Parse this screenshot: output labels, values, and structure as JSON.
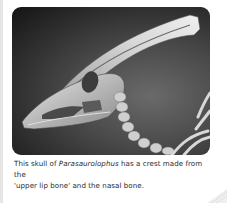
{
  "figure": {
    "image_alt": "Skull of Parasaurolophus with long backward-curving crest",
    "caption": {
      "prefix": "This skull of ",
      "species": "Parasaurolophus",
      "line1_suffix": " has a crest made from the",
      "line2": "'upper lip bone' and the nasal bone."
    }
  },
  "colors": {
    "background": "#ffffff",
    "caption_text": "#2a2a2a",
    "left_rule": "#e6e6e6"
  }
}
